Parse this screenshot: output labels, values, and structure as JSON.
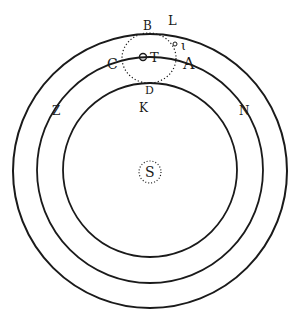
{
  "diagram": {
    "type": "astronomical-orbit-figure",
    "colors": {
      "ink": "#1a1a1a",
      "background": "#ffffff"
    },
    "center": {
      "label": "S"
    },
    "orbits": [
      {
        "name": "outer",
        "radius": 137
      },
      {
        "name": "middle",
        "radius": 113
      },
      {
        "name": "inner",
        "radius": 87
      }
    ],
    "epicycle": {
      "center_label": "T",
      "style": "dotted"
    },
    "labels": {
      "B": "B",
      "L": "L",
      "C": "C",
      "A": "A",
      "D": "D",
      "K": "K",
      "Z": "Z",
      "N": "N",
      "T": "T",
      "c": "c",
      "l": "ɩ",
      "S": "S"
    }
  }
}
